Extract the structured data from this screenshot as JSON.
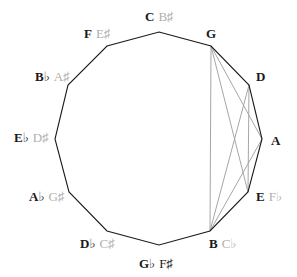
{
  "title_fragment": "",
  "diagram": {
    "type": "circle-of-fifths-dodecagon",
    "polygon_color": "#1a1a1a",
    "chord_color": "#a6a6a6",
    "vertices": [
      {
        "id": "C",
        "x": 159,
        "y": 32,
        "label": "C",
        "alt": "B♯",
        "alt_dark": false,
        "lx": 145,
        "ly": 10,
        "anchor": "left"
      },
      {
        "id": "G",
        "x": 211,
        "y": 46,
        "label": "G",
        "alt": "",
        "alt_dark": false,
        "lx": 206,
        "ly": 27,
        "anchor": "left"
      },
      {
        "id": "D",
        "x": 249,
        "y": 85,
        "label": "D",
        "alt": "",
        "alt_dark": false,
        "lx": 256,
        "ly": 70,
        "anchor": "left"
      },
      {
        "id": "A",
        "x": 262,
        "y": 139,
        "label": "A",
        "alt": "",
        "alt_dark": false,
        "lx": 271,
        "ly": 134,
        "anchor": "left"
      },
      {
        "id": "E",
        "x": 248,
        "y": 192,
        "label": "E",
        "alt": "F♭",
        "alt_dark": false,
        "lx": 256,
        "ly": 190,
        "anchor": "left"
      },
      {
        "id": "B",
        "x": 210,
        "y": 231,
        "label": "B",
        "alt": "C♭",
        "alt_dark": false,
        "lx": 209,
        "ly": 237,
        "anchor": "left"
      },
      {
        "id": "Gb",
        "x": 159,
        "y": 245,
        "label": "G♭",
        "alt": "F♯",
        "alt_dark": true,
        "lx": 139,
        "ly": 257,
        "anchor": "left"
      },
      {
        "id": "Db",
        "x": 107,
        "y": 231,
        "label": "D♭",
        "alt": "C♯",
        "alt_dark": false,
        "lx": 80,
        "ly": 237,
        "anchor": "left"
      },
      {
        "id": "Ab",
        "x": 69,
        "y": 192,
        "label": "A♭",
        "alt": "G♯",
        "alt_dark": false,
        "lx": 29,
        "ly": 190,
        "anchor": "left"
      },
      {
        "id": "Eb",
        "x": 55,
        "y": 139,
        "label": "E♭",
        "alt": "D♯",
        "alt_dark": false,
        "lx": 14,
        "ly": 131,
        "anchor": "left"
      },
      {
        "id": "Bb",
        "x": 68,
        "y": 85,
        "label": "B♭",
        "alt": "A♯",
        "alt_dark": false,
        "lx": 35,
        "ly": 70,
        "anchor": "left"
      },
      {
        "id": "F",
        "x": 107,
        "y": 46,
        "label": "F",
        "alt": "E♯",
        "alt_dark": false,
        "lx": 84,
        "ly": 27,
        "anchor": "left"
      }
    ],
    "chords": [
      [
        "G",
        "A"
      ],
      [
        "G",
        "E"
      ],
      [
        "G",
        "B"
      ],
      [
        "D",
        "E"
      ],
      [
        "D",
        "B"
      ],
      [
        "A",
        "B"
      ]
    ]
  }
}
